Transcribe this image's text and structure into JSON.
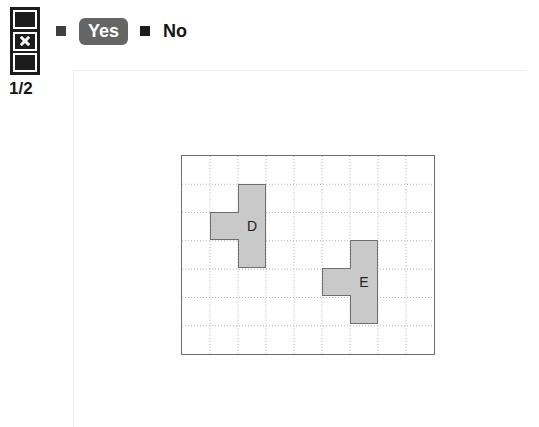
{
  "page_indicator": {
    "icon_name": "page-stack-x-icon",
    "cells": [
      {
        "marked": false
      },
      {
        "marked": true
      },
      {
        "marked": false
      }
    ],
    "counter": "1/2"
  },
  "options": {
    "items": [
      {
        "id": "yes",
        "label": "Yes",
        "bullet": "square-bullet",
        "selected": true
      },
      {
        "id": "no",
        "label": "No",
        "bullet": "square-bullet",
        "selected": false
      }
    ]
  },
  "puzzle": {
    "grid": {
      "columns": 9,
      "rows": 7,
      "cell_size": 28,
      "border_color": "#6f6f6f",
      "gridline_color": "#b6b6b6",
      "gridline_style": "dotted"
    },
    "shapes": [
      {
        "label": "D",
        "fill": "#c9c9c9",
        "stroke": "#6f6f6f",
        "cells": [
          {
            "col": 2,
            "row": 1
          },
          {
            "col": 1,
            "row": 2
          },
          {
            "col": 2,
            "row": 2
          },
          {
            "col": 2,
            "row": 3
          }
        ],
        "label_cell": {
          "col": 2,
          "row": 2
        }
      },
      {
        "label": "E",
        "fill": "#c9c9c9",
        "stroke": "#6f6f6f",
        "cells": [
          {
            "col": 6,
            "row": 3
          },
          {
            "col": 5,
            "row": 4
          },
          {
            "col": 6,
            "row": 4
          },
          {
            "col": 6,
            "row": 5
          }
        ],
        "label_cell": {
          "col": 6,
          "row": 4
        }
      }
    ]
  }
}
